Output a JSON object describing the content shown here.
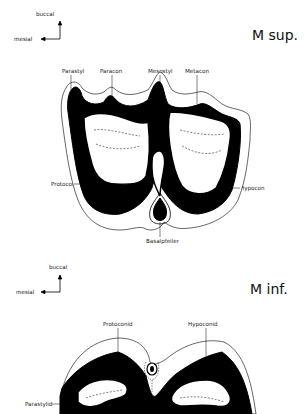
{
  "upper": {
    "title": "M sup.",
    "orientation": {
      "vertical": "buccal",
      "horizontal": "mesial"
    },
    "labels": {
      "parastyl": "Parastyl",
      "paracon": "Paracon",
      "mesostyl": "Mesostyl",
      "metacon": "Metacon",
      "protocon": "Protocon",
      "hypocon": "Hypocon",
      "basalpfeiler": "Basalpfeiler"
    }
  },
  "lower": {
    "title": "M inf.",
    "orientation": {
      "vertical": "buccal",
      "horizontal": "mesial"
    },
    "labels": {
      "protoconid": "Protoconid",
      "hypoconid": "Hypoconid",
      "parastylid": "Parastylid"
    }
  },
  "colors": {
    "ink": "#000000",
    "paper": "#ffffff"
  }
}
